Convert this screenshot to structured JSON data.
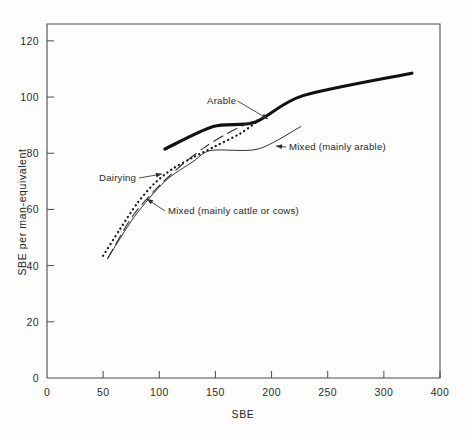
{
  "chart_data": {
    "type": "line",
    "title": "",
    "xlabel": "SBE",
    "ylabel": "SBE per man-equivalent",
    "xlim": [
      0,
      350
    ],
    "ylim": [
      0,
      126
    ],
    "grid": false,
    "legend_position": "inline-annotations",
    "x_ticks": [
      {
        "value": 0,
        "label": "0"
      },
      {
        "value": 50,
        "label": "50"
      },
      {
        "value": 100,
        "label": "100"
      },
      {
        "value": 150,
        "label": "150"
      },
      {
        "value": 200,
        "label": "200"
      },
      {
        "value": 250,
        "label": "250"
      },
      {
        "value": 300,
        "label": "300"
      },
      {
        "value": 350,
        "label": "400"
      }
    ],
    "y_ticks": [
      {
        "value": 0,
        "label": "0"
      },
      {
        "value": 20,
        "label": "20"
      },
      {
        "value": 40,
        "label": "40"
      },
      {
        "value": 60,
        "label": "60"
      },
      {
        "value": 80,
        "label": "80"
      },
      {
        "value": 100,
        "label": "100"
      },
      {
        "value": 120,
        "label": "120"
      }
    ],
    "series": [
      {
        "name": "Arable",
        "style": "bold-solid",
        "color": "#101010",
        "points": [
          [
            105,
            81.5
          ],
          [
            148,
            89.5
          ],
          [
            185,
            91.0
          ],
          [
            228,
            100.5
          ],
          [
            325,
            108.5
          ]
        ]
      },
      {
        "name": "Dairying",
        "style": "dotted",
        "color": "#151515",
        "points": [
          [
            50,
            43.5
          ],
          [
            65,
            53.0
          ],
          [
            80,
            62.0
          ],
          [
            95,
            69.0
          ],
          [
            112,
            74.5
          ],
          [
            130,
            78.5
          ],
          [
            150,
            82.5
          ],
          [
            172,
            87.0
          ],
          [
            188,
            91.5
          ]
        ]
      },
      {
        "name": "Mixed (mainly cattle or cows)",
        "style": "dashed",
        "color": "#2a2a2a",
        "points": [
          [
            54,
            42.5
          ],
          [
            76,
            57.5
          ],
          [
            100,
            68.5
          ],
          [
            122,
            76.5
          ],
          [
            140,
            82.0
          ],
          [
            158,
            86.5
          ],
          [
            178,
            90.5
          ],
          [
            188,
            92.0
          ]
        ]
      },
      {
        "name": "Mixed (mainly arable)",
        "style": "thin-solid",
        "color": "#303030",
        "points": [
          [
            54,
            42.5
          ],
          [
            78,
            57.5
          ],
          [
            105,
            70.0
          ],
          [
            130,
            77.0
          ],
          [
            146,
            81.0
          ],
          [
            188,
            81.5
          ],
          [
            226,
            89.5
          ]
        ]
      }
    ],
    "annotations": [
      {
        "text": "Arable",
        "text_x": 207,
        "text_y": 104,
        "anchor": "start",
        "target_x": 268,
        "target_y": 119
      },
      {
        "text": "Dairying",
        "text_x": 99,
        "text_y": 181,
        "anchor": "start",
        "target_x": 162,
        "target_y": 174
      },
      {
        "text": "Mixed (mainly cattle or cows)",
        "text_x": 168,
        "text_y": 214,
        "anchor": "start",
        "target_x": 147,
        "target_y": 199
      },
      {
        "text": "Mixed (mainly arable)",
        "text_x": 289,
        "text_y": 150,
        "anchor": "start",
        "target_x": 276,
        "target_y": 146
      }
    ]
  },
  "plot_area": {
    "left": 47,
    "right": 440,
    "top": 24,
    "bottom": 378
  }
}
